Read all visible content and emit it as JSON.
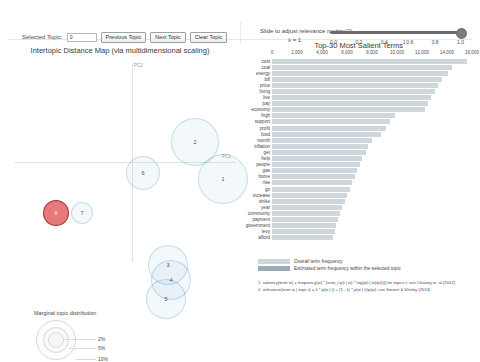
{
  "controls": {
    "selected_topic_label": "Selected Topic:",
    "selected_topic_value": "0",
    "previous_topic_label": "Previous Topic",
    "next_topic_label": "Next Topic",
    "clear_topic_label": "Clear Topic",
    "slider_label": "Slide to adjust relevance metric:(2)",
    "lambda_label": "λ = 1",
    "slider_value": 1.0,
    "slider_ticks": [
      "0.0",
      "0.2",
      "0.4",
      "0.6",
      "0.8",
      "1.0"
    ]
  },
  "left_panel": {
    "title": "Intertopic Distance Map (via multidimensional scaling)",
    "axis_x_label": "PC1",
    "axis_y_label": "PC2",
    "marginal_title": "Marginal topic distribution",
    "marginal_ticks": [
      "2%",
      "5%",
      "10%"
    ]
  },
  "right_panel": {
    "title": "Top-30 Most Salient Terms",
    "title_sup": "1",
    "legend": [
      {
        "key": "overall",
        "label": "Overall term frequency",
        "color": "#cfd6dc"
      },
      {
        "key": "topic",
        "label": "Estimated term frequency within the selected topic",
        "color": "#9aaab6"
      }
    ],
    "notes": [
      "1. saliency(term w) = frequency(w) * [sum_t p(t | w) * log(p(t | w)/p(t))] for topics t; see Chuang et. al (2012)",
      "2. relevance(term w | topic t) = λ * p(w | t) + (1 - λ) * p(w | t)/p(w); see Sievert & Shirley (2014)"
    ]
  },
  "chart_data": {
    "type": "bar",
    "title": "Top-30 Most Salient Terms",
    "xlabel": "",
    "ylabel": "",
    "xlim": [
      0,
      16000
    ],
    "xticks": [
      0,
      2000,
      4000,
      6000,
      8000,
      10000,
      12000,
      14000,
      16000
    ],
    "xtick_labels": [
      "0",
      "2,000",
      "4,000",
      "6,000",
      "8,000",
      "10,000",
      "12,000",
      "14,000",
      "16,000"
    ],
    "grid": false,
    "orientation": "horizontal",
    "legend_position": "bottom-left",
    "categories": [
      "cost",
      "coal",
      "energy",
      "bill",
      "price",
      "living",
      "live",
      "pay",
      "economy",
      "high",
      "support",
      "profit",
      "food",
      "month",
      "inflation",
      "get",
      "help",
      "people",
      "gas",
      "home",
      "rise",
      "go",
      "increase",
      "strike",
      "year",
      "community",
      "payment",
      "government",
      "levy",
      "afford"
    ],
    "series": [
      {
        "name": "Overall term frequency",
        "values": [
          15600,
          14400,
          14100,
          13600,
          13300,
          13000,
          12700,
          12500,
          12200,
          9800,
          9400,
          9100,
          8700,
          8000,
          7700,
          7500,
          7200,
          7000,
          6800,
          6600,
          6400,
          6200,
          6000,
          5800,
          5600,
          5400,
          5300,
          5100,
          5000,
          4900
        ]
      },
      {
        "name": "Estimated term frequency within the selected topic",
        "values": [
          0,
          0,
          0,
          0,
          0,
          0,
          0,
          0,
          0,
          0,
          0,
          0,
          0,
          0,
          0,
          0,
          0,
          0,
          0,
          0,
          0,
          0,
          0,
          0,
          0,
          0,
          0,
          0,
          0,
          0
        ]
      }
    ]
  },
  "topics": [
    {
      "id": "8",
      "x": 48,
      "y": 155,
      "r": 13,
      "selected": true
    },
    {
      "id": "7",
      "x": 74,
      "y": 155,
      "r": 11,
      "selected": false
    },
    {
      "id": "6",
      "x": 135,
      "y": 115,
      "r": 17,
      "selected": false
    },
    {
      "id": "2",
      "x": 187,
      "y": 84,
      "r": 24,
      "selected": false
    },
    {
      "id": "1",
      "x": 215,
      "y": 121,
      "r": 25,
      "selected": false
    },
    {
      "id": "3",
      "x": 160,
      "y": 207,
      "r": 20,
      "selected": false
    },
    {
      "id": "4",
      "x": 163,
      "y": 222,
      "r": 20,
      "selected": false
    },
    {
      "id": "5",
      "x": 158,
      "y": 241,
      "r": 20,
      "selected": false
    }
  ]
}
